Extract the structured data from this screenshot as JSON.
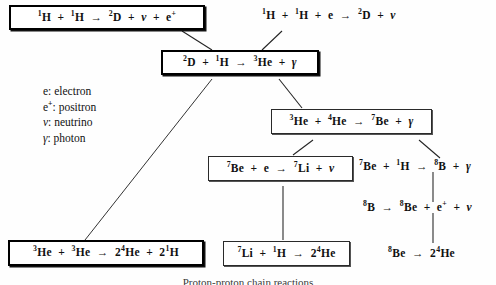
{
  "figure": {
    "type": "flowchart-diagram",
    "background_color": "#fefefe",
    "text_color": "#111111",
    "caption_partial": "Proton-proton chain reactions"
  },
  "nodes": {
    "pp1": {
      "id": "pp1",
      "label": "1H + 1H → 2D + ν + e+",
      "style": "boxed-heavy",
      "parts": [
        {
          "sup": "1",
          "text": "H"
        },
        {
          "op": "+"
        },
        {
          "sup": "1",
          "text": "H"
        },
        {
          "op": "→"
        },
        {
          "sup": "2",
          "text": "D"
        },
        {
          "op": "+"
        },
        {
          "text": "ν",
          "greek": true
        },
        {
          "op": "+"
        },
        {
          "text": "e",
          "sup_after": "+"
        }
      ]
    },
    "pep": {
      "id": "pep",
      "label": "1H + 1H + e → 2D + ν",
      "style": "plain"
    },
    "d_p": {
      "id": "d_p",
      "label": "2D + 1H → 3He + γ",
      "style": "boxed-heavy"
    },
    "he3_he4": {
      "id": "he3_he4",
      "label": "3He + 4He → 7Be + γ",
      "style": "boxed-thin"
    },
    "be7_e": {
      "id": "be7_e",
      "label": "7Be + e → 7Li + ν",
      "style": "boxed-thin"
    },
    "be7_p": {
      "id": "be7_p",
      "label": "7Be + 1H → 8B + γ",
      "style": "plain"
    },
    "b8_decay": {
      "id": "b8_decay",
      "label": "8B → 8Be + e+ + ν",
      "style": "plain"
    },
    "be8_decay": {
      "id": "be8_decay",
      "label": "8Be → 2 4He",
      "style": "plain"
    },
    "he3_he3": {
      "id": "he3_he3",
      "label": "3He + 3He → 2 4He + 2 1H",
      "style": "boxed-heavy"
    },
    "li7_p": {
      "id": "li7_p",
      "label": "7Li + 1H → 2 4He",
      "style": "boxed-thin"
    }
  },
  "legend": {
    "items": [
      {
        "symbol": "e",
        "definition": "electron",
        "line": "e: electron"
      },
      {
        "symbol": "e+",
        "definition": "positron",
        "line": "e+: positron"
      },
      {
        "symbol": "ν",
        "definition": "neutrino",
        "line": "ν: neutrino"
      },
      {
        "symbol": "γ",
        "definition": "photon",
        "line": "γ: photon"
      }
    ]
  },
  "edges": [
    {
      "from": "pp1",
      "to": "d_p",
      "kind": "diagonal"
    },
    {
      "from": "pep",
      "to": "d_p",
      "kind": "diagonal"
    },
    {
      "from": "d_p",
      "to": "he3_he3",
      "kind": "diagonal-long"
    },
    {
      "from": "d_p",
      "to": "he3_he4",
      "kind": "diagonal"
    },
    {
      "from": "he3_he4",
      "to": "be7_e",
      "kind": "diagonal"
    },
    {
      "from": "he3_he4",
      "to": "be7_p",
      "kind": "diagonal"
    },
    {
      "from": "be7_e",
      "to": "li7_p",
      "kind": "vertical"
    },
    {
      "from": "be7_p",
      "to": "b8_decay",
      "kind": "vertical"
    },
    {
      "from": "b8_decay",
      "to": "be8_decay",
      "kind": "vertical"
    }
  ]
}
